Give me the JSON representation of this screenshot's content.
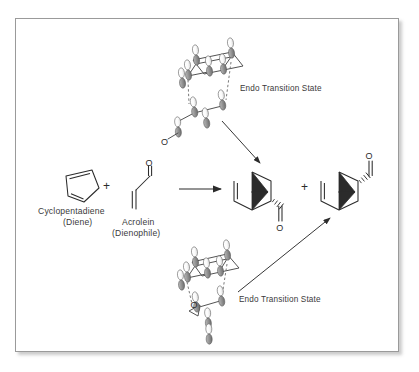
{
  "figure": {
    "background_color": "#ffffff",
    "frame_border_color": "#9a9a9a",
    "ink_color": "#2b2b2b",
    "text_color": "#3a3a3a",
    "orbital_lobe_light": "#ffffff",
    "orbital_lobe_dark": "#8f8f8f"
  },
  "reactants": {
    "diene": {
      "name": "Cyclopentadiene",
      "role": "(Diene)",
      "structure": "cyclopentadiene-ring"
    },
    "plus_symbol": "+",
    "dienophile": {
      "name": "Acrolein",
      "role": "(Dienophile)",
      "structure": "acrolein",
      "atom_labels": [
        "O"
      ]
    }
  },
  "reaction_arrow": {
    "name": "main-reaction-arrow",
    "direction": "right"
  },
  "products": {
    "plus_symbol": "+",
    "items": [
      {
        "name": "endo-norbornene-carbaldehyde-down",
        "structure": "bicyclo[2.2.1]heptene",
        "substituent": "CHO",
        "stereo_bond": "hashed-wedge",
        "substituent_orientation": "down",
        "atom_labels": [
          "O"
        ]
      },
      {
        "name": "endo-norbornene-carbaldehyde-up",
        "structure": "bicyclo[2.2.1]heptene",
        "substituent": "CHO",
        "stereo_bond": "hashed-wedge",
        "substituent_orientation": "up",
        "atom_labels": [
          "O"
        ]
      }
    ]
  },
  "transition_states": [
    {
      "id": "upper",
      "label": "Endo Transition State",
      "position": "top",
      "atom_labels": [
        "O"
      ],
      "orbital_count": 10,
      "arrow_to": "product-1",
      "arrow_direction": "down-right"
    },
    {
      "id": "lower",
      "label": "Endo Transition State",
      "position": "bottom",
      "atom_labels": [
        "O"
      ],
      "orbital_count": 10,
      "arrow_to": "product-2",
      "arrow_direction": "up-right"
    }
  ]
}
